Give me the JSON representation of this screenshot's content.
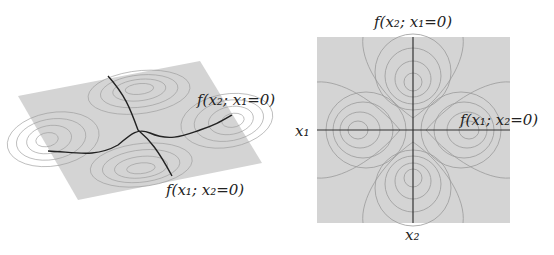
{
  "figure": {
    "left_panel": {
      "name": "3d-surface",
      "labels": {
        "curve_x2": "f(x₂; x₁=0)",
        "curve_x1": "f(x₁; x₂=0)"
      }
    },
    "right_panel": {
      "name": "contour-plot",
      "labels": {
        "top": "f(x₂; x₁=0)",
        "right": "f(x₁; x₂=0)",
        "axis_x1": "x₁",
        "axis_x2": "x₂"
      }
    },
    "colors": {
      "surface": "#d4d4d4",
      "contour": "#9a9a9a",
      "curve": "#222222"
    }
  }
}
